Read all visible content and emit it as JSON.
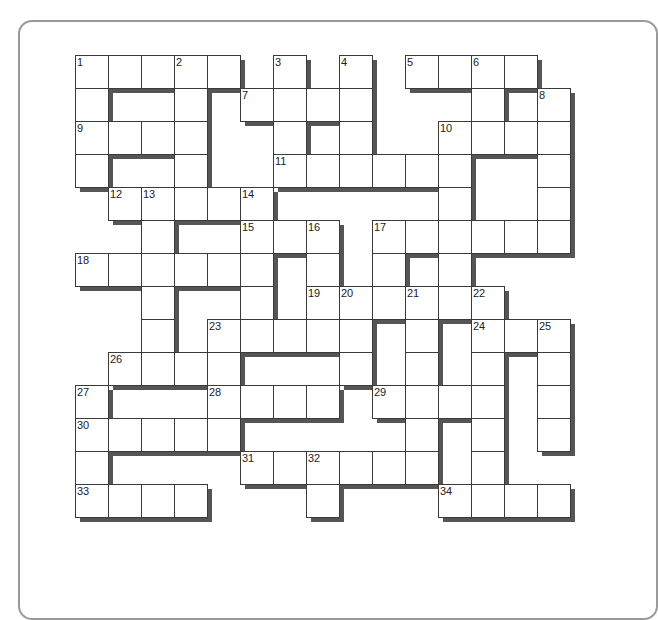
{
  "puzzle": {
    "type": "crossword",
    "cell_size": 33,
    "rows": 14,
    "cols": 15,
    "colors": {
      "border": "#3a3a3a",
      "shadow": "#555555",
      "cell": "#ffffff",
      "panel_border": "#9a9a9a"
    },
    "cells": [
      [
        0,
        [
          0,
          1,
          2,
          3,
          4,
          6,
          8,
          10,
          11,
          12,
          13
        ]
      ],
      [
        1,
        [
          0,
          3,
          5,
          6,
          7,
          8,
          12,
          14
        ]
      ],
      [
        2,
        [
          0,
          1,
          2,
          3,
          6,
          8,
          11,
          12,
          13,
          14
        ]
      ],
      [
        3,
        [
          0,
          3,
          6,
          7,
          8,
          9,
          10,
          11,
          14
        ]
      ],
      [
        4,
        [
          1,
          2,
          3,
          4,
          5,
          11,
          14
        ]
      ],
      [
        5,
        [
          2,
          5,
          6,
          7,
          9,
          10,
          11,
          12,
          13,
          14
        ]
      ],
      [
        6,
        [
          0,
          1,
          2,
          3,
          4,
          5,
          7,
          9,
          11
        ]
      ],
      [
        7,
        [
          2,
          5,
          7,
          8,
          9,
          10,
          11,
          12
        ]
      ],
      [
        8,
        [
          2,
          4,
          5,
          6,
          7,
          8,
          10,
          12,
          13,
          14
        ]
      ],
      [
        9,
        [
          1,
          2,
          3,
          4,
          8,
          10,
          12,
          14
        ]
      ],
      [
        10,
        [
          0,
          4,
          5,
          6,
          7,
          9,
          10,
          11,
          12,
          14
        ]
      ],
      [
        11,
        [
          0,
          1,
          2,
          3,
          4,
          10,
          12,
          14
        ]
      ],
      [
        12,
        [
          0,
          5,
          6,
          7,
          8,
          9,
          10,
          12
        ]
      ],
      [
        13,
        [
          0,
          1,
          2,
          3,
          7,
          11,
          12,
          13,
          14
        ]
      ]
    ],
    "numbers": [
      {
        "n": "1",
        "r": 0,
        "c": 0
      },
      {
        "n": "2",
        "r": 0,
        "c": 3
      },
      {
        "n": "3",
        "r": 0,
        "c": 6
      },
      {
        "n": "4",
        "r": 0,
        "c": 8
      },
      {
        "n": "5",
        "r": 0,
        "c": 10
      },
      {
        "n": "6",
        "r": 0,
        "c": 12
      },
      {
        "n": "7",
        "r": 1,
        "c": 5
      },
      {
        "n": "8",
        "r": 1,
        "c": 14
      },
      {
        "n": "9",
        "r": 2,
        "c": 0
      },
      {
        "n": "10",
        "r": 2,
        "c": 11
      },
      {
        "n": "11",
        "r": 3,
        "c": 6
      },
      {
        "n": "12",
        "r": 4,
        "c": 1
      },
      {
        "n": "13",
        "r": 4,
        "c": 2
      },
      {
        "n": "14",
        "r": 4,
        "c": 5
      },
      {
        "n": "15",
        "r": 5,
        "c": 5
      },
      {
        "n": "16",
        "r": 5,
        "c": 7
      },
      {
        "n": "17",
        "r": 5,
        "c": 9
      },
      {
        "n": "18",
        "r": 6,
        "c": 0
      },
      {
        "n": "19",
        "r": 7,
        "c": 7
      },
      {
        "n": "20",
        "r": 7,
        "c": 8
      },
      {
        "n": "21",
        "r": 7,
        "c": 10
      },
      {
        "n": "22",
        "r": 7,
        "c": 12
      },
      {
        "n": "23",
        "r": 8,
        "c": 4
      },
      {
        "n": "24",
        "r": 8,
        "c": 12
      },
      {
        "n": "25",
        "r": 8,
        "c": 14
      },
      {
        "n": "26",
        "r": 9,
        "c": 1
      },
      {
        "n": "27",
        "r": 10,
        "c": 0
      },
      {
        "n": "28",
        "r": 10,
        "c": 4
      },
      {
        "n": "29",
        "r": 10,
        "c": 9
      },
      {
        "n": "30",
        "r": 11,
        "c": 0
      },
      {
        "n": "31",
        "r": 12,
        "c": 5
      },
      {
        "n": "32",
        "r": 12,
        "c": 7
      },
      {
        "n": "33",
        "r": 13,
        "c": 0
      },
      {
        "n": "34",
        "r": 13,
        "c": 11
      }
    ]
  }
}
